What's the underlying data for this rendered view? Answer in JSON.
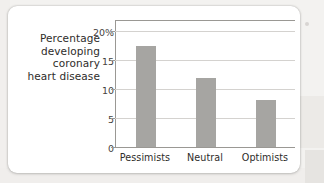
{
  "chart_data": {
    "type": "bar",
    "title": "",
    "subtitle": "",
    "xlabel": "",
    "ylabel": "Percentage developing coronary heart disease",
    "ylabel_lines": [
      "Percentage",
      "developing",
      "coronary",
      "heart disease"
    ],
    "categories": [
      "Pessimists",
      "Neutral",
      "Optimists"
    ],
    "values": [
      17.4,
      11.8,
      8.0
    ],
    "ylim": [
      0,
      22
    ],
    "yticks": [
      0,
      5,
      10,
      15,
      20
    ],
    "ytick_labels": [
      "0",
      "5",
      "10",
      "15",
      "20%"
    ],
    "grid": true,
    "grid_axis": "y",
    "legend": false,
    "legend_position": "none",
    "bar_color": "#a6a5a2",
    "gridline_color": "#d4d2cf",
    "axis_color": "#9a9894",
    "text_color": "#2e2c2a",
    "plot_background": "#ffffff"
  },
  "card": {
    "background": "#ffffff",
    "page_background": "#f3f2f0"
  }
}
